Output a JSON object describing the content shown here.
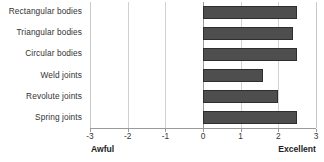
{
  "chart_data": {
    "type": "bar",
    "orientation": "horizontal",
    "title": "",
    "subtitle": "",
    "xlabel": "",
    "ylabel": "",
    "categories": [
      "Rectangular bodies",
      "Triangular  bodies",
      "Circular bodies",
      "Weld joints",
      "Revolute joints",
      "Spring joints"
    ],
    "values": [
      2.5,
      2.4,
      2.5,
      1.6,
      2.0,
      2.5
    ],
    "series": [
      {
        "name": "Rating",
        "values": [
          2.5,
          2.4,
          2.5,
          1.6,
          2.0,
          2.5
        ]
      }
    ],
    "xlim": [
      -3,
      3
    ],
    "xticks": [
      -3,
      -2,
      -1,
      0,
      1,
      2,
      3
    ],
    "xtick_labels": [
      "-3",
      "-2",
      "-1",
      "0",
      "1",
      "2",
      "3"
    ],
    "grid": true,
    "grid_axis": "x",
    "legend": false,
    "legend_position": "none",
    "annotations": {
      "scale_low_anchor": "Awful",
      "scale_high_anchor": "Excellent"
    },
    "bar_color": "#4e4e4e",
    "bar_border_color": "#2e2e2e",
    "gridline_color": "#d2d2d2",
    "axis_color": "#9a9a9a",
    "background_color": "#ffffff"
  }
}
